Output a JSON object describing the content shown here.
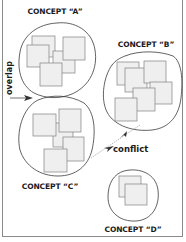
{
  "diagram": {
    "concepts": [
      {
        "id": "A",
        "label": "CONCEPT “A”",
        "squares": 5
      },
      {
        "id": "B",
        "label": "CONCEPT “B”",
        "squares": 6
      },
      {
        "id": "C",
        "label": "CONCEPT “C”",
        "squares": 5
      },
      {
        "id": "D",
        "label": "CONCEPT “D”",
        "squares": 2
      }
    ],
    "relations": [
      {
        "label": "overlap",
        "between": [
          "A",
          "C"
        ]
      },
      {
        "label": "conflict",
        "between": [
          "B",
          "C"
        ]
      }
    ]
  },
  "colors": {
    "outline": "#3a3a3a",
    "square_fill": "#efefef",
    "square_stroke": "#808080",
    "arrow": "#333333",
    "frame": "#8a8a8a"
  }
}
